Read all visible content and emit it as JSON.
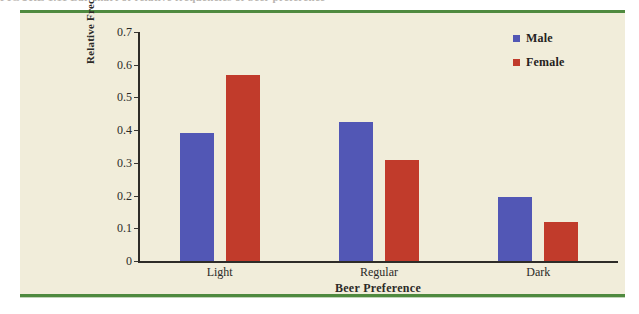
{
  "page": {
    "caption_sliver": "FIGURE 1.11   Bar chart of relative frequencies of beer preference",
    "background_color": "#f1edda",
    "rule_color": "#4f8a3f"
  },
  "legend": {
    "position": "top-right",
    "entries": [
      {
        "label": "Male",
        "color": "#5257b5",
        "swatch_name": "legend-swatch-male"
      },
      {
        "label": "Female",
        "color": "#c13b2b",
        "swatch_name": "legend-swatch-female"
      }
    ]
  },
  "chart_data": {
    "type": "bar",
    "title": "",
    "xlabel": "Beer Preference",
    "ylabel": "Relative Frequencies",
    "categories": [
      "Light",
      "Regular",
      "Dark"
    ],
    "series": [
      {
        "name": "Male",
        "color": "#5257b5",
        "values": [
          0.39,
          0.425,
          0.195
        ]
      },
      {
        "name": "Female",
        "color": "#c13b2b",
        "values": [
          0.57,
          0.31,
          0.12
        ]
      }
    ],
    "ylim": [
      0,
      0.7
    ],
    "yticks": [
      "0.7",
      "0.6",
      "0.5",
      "0.4",
      "0.3",
      "0.2",
      "0.1",
      "0"
    ],
    "ytick_values": [
      0.7,
      0.6,
      0.5,
      0.4,
      0.3,
      0.2,
      0.1,
      0
    ],
    "grid": false,
    "legend_position": "top-right"
  }
}
